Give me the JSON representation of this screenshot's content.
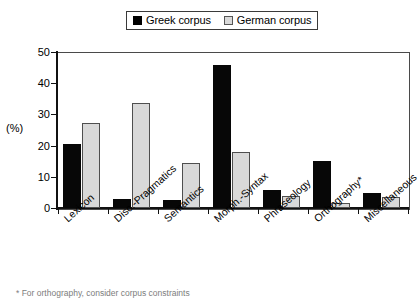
{
  "chart_data": {
    "type": "bar",
    "title": "",
    "xlabel": "",
    "ylabel": "(%)",
    "ylim": [
      0,
      50
    ],
    "yticks": [
      0,
      10,
      20,
      30,
      40,
      50
    ],
    "grid": false,
    "legend_position": "top-center",
    "categories": [
      "Lexicon",
      "Disc.-Pragmatics",
      "Semantics",
      "Morph.-Syntax",
      "Phraseology",
      "Orthography*",
      "Miscellaneous"
    ],
    "series": [
      {
        "name": "Greek corpus",
        "color": "#000000",
        "values": [
          20.5,
          3.0,
          2.5,
          45.8,
          5.8,
          15.1,
          4.8
        ]
      },
      {
        "name": "German corpus",
        "color": "#d9d9d9",
        "values": [
          27.2,
          33.6,
          14.4,
          17.9,
          3.9,
          1.6,
          3.5
        ]
      }
    ],
    "annotations": [
      "* For orthography, consider corpus constraints"
    ]
  },
  "legend": {
    "items": [
      {
        "label": "Greek corpus",
        "swatch": "filled-black-square"
      },
      {
        "label": "German corpus",
        "swatch": "outlined-gray-square"
      }
    ]
  },
  "footnote": "* For orthography, consider corpus constraints"
}
